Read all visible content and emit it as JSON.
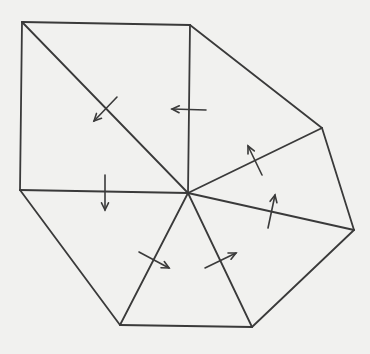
{
  "diagram": {
    "colors": {
      "background": "#f1f1ef",
      "stroke": "#3a3a3a"
    },
    "center": [
      188,
      193
    ],
    "outer_vertices": [
      [
        22,
        22
      ],
      [
        190,
        25
      ],
      [
        322,
        128
      ],
      [
        354,
        230
      ],
      [
        252,
        327
      ],
      [
        120,
        325
      ],
      [
        20,
        190
      ]
    ],
    "edges": [
      {
        "name": "top-edge",
        "from": [
          22,
          22
        ],
        "to": [
          190,
          25
        ]
      },
      {
        "name": "upper-right-edge",
        "from": [
          190,
          25
        ],
        "to": [
          322,
          128
        ]
      },
      {
        "name": "right-edge",
        "from": [
          322,
          128
        ],
        "to": [
          354,
          230
        ]
      },
      {
        "name": "lower-right-edge",
        "from": [
          354,
          230
        ],
        "to": [
          252,
          327
        ]
      },
      {
        "name": "bottom-edge",
        "from": [
          252,
          327
        ],
        "to": [
          120,
          325
        ]
      },
      {
        "name": "lower-left-edge",
        "from": [
          120,
          325
        ],
        "to": [
          20,
          190
        ]
      },
      {
        "name": "left-edge",
        "from": [
          20,
          190
        ],
        "to": [
          22,
          22
        ]
      },
      {
        "name": "spoke-top-left",
        "from": [
          188,
          193
        ],
        "to": [
          22,
          22
        ]
      },
      {
        "name": "spoke-top",
        "from": [
          188,
          193
        ],
        "to": [
          190,
          25
        ]
      },
      {
        "name": "spoke-upper-right",
        "from": [
          188,
          193
        ],
        "to": [
          322,
          128
        ]
      },
      {
        "name": "spoke-right",
        "from": [
          188,
          193
        ],
        "to": [
          354,
          230
        ]
      },
      {
        "name": "spoke-lower-right",
        "from": [
          188,
          193
        ],
        "to": [
          252,
          327
        ]
      },
      {
        "name": "spoke-lower-left",
        "from": [
          188,
          193
        ],
        "to": [
          120,
          325
        ]
      },
      {
        "name": "spoke-left",
        "from": [
          188,
          193
        ],
        "to": [
          20,
          190
        ]
      }
    ],
    "arrows": [
      {
        "name": "arrow-down-left",
        "from": [
          117,
          97
        ],
        "to": [
          94,
          121
        ]
      },
      {
        "name": "arrow-left",
        "from": [
          206,
          110
        ],
        "to": [
          172,
          109
        ]
      },
      {
        "name": "arrow-up-left",
        "from": [
          262,
          175
        ],
        "to": [
          248,
          146
        ]
      },
      {
        "name": "arrow-up",
        "from": [
          268,
          228
        ],
        "to": [
          275,
          195
        ]
      },
      {
        "name": "arrow-down",
        "from": [
          105,
          175
        ],
        "to": [
          105,
          210
        ]
      },
      {
        "name": "arrow-down-right",
        "from": [
          139,
          252
        ],
        "to": [
          169,
          268
        ]
      },
      {
        "name": "arrow-up-right",
        "from": [
          205,
          268
        ],
        "to": [
          236,
          253
        ]
      }
    ]
  }
}
